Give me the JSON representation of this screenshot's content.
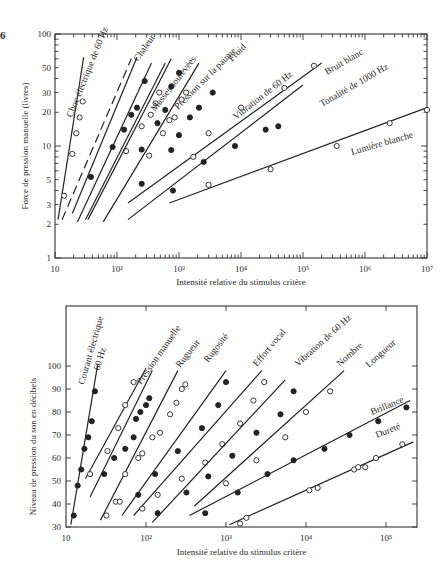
{
  "figure_number": "6",
  "chart_data": [
    {
      "type": "scatter",
      "scale": "log-log",
      "title": "",
      "xlabel": "Intensité relative du stimulus critère",
      "ylabel": "Force de pression manuelle (livres)",
      "xlim": [
        10,
        10000000
      ],
      "ylim": [
        1,
        100
      ],
      "xticks": [
        "10",
        "10²",
        "10³",
        "10⁴",
        "10⁵",
        "10⁶",
        "10⁷"
      ],
      "yticks": [
        1,
        2,
        3,
        5,
        10,
        20,
        30,
        50,
        100
      ],
      "grid": false,
      "legend": "inline labels",
      "series": [
        {
          "name": "Choc électrique de 60 Hz",
          "marker": "open",
          "line": [
            [
              11.2,
              2.2
            ],
            [
              29,
              62
            ]
          ],
          "points": [
            [
              14,
              3.6
            ],
            [
              19,
              8.5
            ],
            [
              22,
              13
            ],
            [
              25,
              18
            ],
            [
              28,
              25
            ]
          ]
        },
        {
          "name": "(ligne pointillée)",
          "marker": "none",
          "dashed": true,
          "line": [
            [
              13,
              2.2
            ],
            [
              170,
              60
            ]
          ],
          "points": []
        },
        {
          "name": "Chaleur",
          "marker": "filled",
          "line": [
            [
              19,
              2.5
            ],
            [
              210,
              62
            ]
          ],
          "points": [
            [
              38,
              5.3
            ],
            [
              85,
              9.8
            ],
            [
              130,
              14
            ],
            [
              170,
              19
            ],
            [
              210,
              22
            ],
            [
              280,
              38
            ]
          ]
        },
        {
          "name": "Masses soulevées",
          "marker": "open",
          "line": [
            [
              23,
              2.1
            ],
            [
              360,
              55
            ]
          ],
          "points": [
            [
              140,
              9
            ],
            [
              250,
              15
            ],
            [
              350,
              19
            ],
            [
              420,
              24
            ],
            [
              480,
              30
            ]
          ]
        },
        {
          "name": "Pression sur la paume",
          "marker": "filled",
          "line": [
            [
              31,
              2.2
            ],
            [
              600,
              55
            ]
          ],
          "points": [
            [
              250,
              9.3
            ],
            [
              450,
              16
            ],
            [
              600,
              21
            ],
            [
              750,
              34
            ],
            [
              1000,
              45
            ]
          ]
        },
        {
          "name": "Froid",
          "marker": "open",
          "line": [
            [
              34,
              2.2
            ],
            [
              750,
              60
            ]
          ],
          "points": [
            [
              330,
              8.2
            ],
            [
              550,
              13
            ],
            [
              700,
              17
            ],
            [
              850,
              18
            ],
            [
              1100,
              26
            ],
            [
              1300,
              30
            ]
          ]
        },
        {
          "name": "Vibration de 60 Hz",
          "marker": "filled",
          "line": [
            [
              60,
              2.1
            ],
            [
              2100,
              55
            ]
          ],
          "points": [
            [
              250,
              4.6
            ],
            [
              750,
              9.2
            ],
            [
              1000,
              12.5
            ],
            [
              1500,
              18
            ],
            [
              2100,
              22
            ],
            [
              3500,
              30
            ]
          ]
        },
        {
          "name": "Bruit blanc",
          "marker": "open",
          "line": [
            [
              150,
              3.1
            ],
            [
              200000,
              55
            ]
          ],
          "points": [
            [
              1700,
              8
            ],
            [
              3000,
              13
            ],
            [
              10000,
              22
            ],
            [
              50000,
              33
            ],
            [
              150000,
              52
            ]
          ]
        },
        {
          "name": "Tonalité de 1000 Hz",
          "marker": "filled",
          "line": [
            [
              150,
              2.2
            ],
            [
              100000,
              35
            ]
          ],
          "points": [
            [
              800,
              4
            ],
            [
              2500,
              7.2
            ],
            [
              8000,
              10
            ],
            [
              25000,
              14
            ],
            [
              40000,
              15
            ]
          ]
        },
        {
          "name": "Lumière blanche",
          "marker": "open",
          "line": [
            [
              700,
              3.1
            ],
            [
              10000000,
              22
            ]
          ],
          "points": [
            [
              3000,
              4.5
            ],
            [
              30000,
              6.2
            ],
            [
              350000,
              10
            ],
            [
              2500000,
              16
            ],
            [
              10000000,
              21
            ]
          ]
        }
      ]
    },
    {
      "type": "scatter",
      "scale": "semilog-x",
      "title": "",
      "xlabel": "Intensité relative du stimulus critère",
      "ylabel": "Niveau de pression du son en décibels",
      "xlim": [
        10,
        250000
      ],
      "ylim": [
        30,
        120
      ],
      "xticks": [
        "10",
        "10²",
        "10³",
        "10⁴",
        "10⁵"
      ],
      "yticks": [
        30,
        40,
        50,
        60,
        70,
        80,
        90,
        100
      ],
      "grid": false,
      "legend": "inline labels",
      "series": [
        {
          "name": "Courant électrique 60 Hz",
          "marker": "filled",
          "line": [
            [
              11.5,
              31
            ],
            [
              25,
              101
            ]
          ],
          "points": [
            [
              12.5,
              35
            ],
            [
              14,
              48
            ],
            [
              15.5,
              55
            ],
            [
              17,
              64
            ],
            [
              19,
              69
            ],
            [
              21,
              76
            ],
            [
              23,
              89
            ]
          ]
        },
        {
          "name": "Pression manuelle",
          "marker": "open",
          "line": [
            [
              17.5,
              51
            ],
            [
              100,
              99
            ]
          ],
          "points": [
            [
              20,
              53
            ],
            [
              33,
              63
            ],
            [
              45,
              73
            ],
            [
              55,
              83
            ],
            [
              70,
              93
            ]
          ]
        },
        {
          "name": "Rugueur",
          "marker": "filled",
          "line": [
            [
              20,
              43
            ],
            [
              120,
              98
            ]
          ],
          "points": [
            [
              30,
              53
            ],
            [
              40,
              60
            ],
            [
              55,
              64
            ],
            [
              70,
              69
            ],
            [
              75,
              77
            ],
            [
              85,
              80
            ],
            [
              100,
              83
            ],
            [
              110,
              86
            ]
          ]
        },
        {
          "name": "Rugosité",
          "marker": "open",
          "line": [
            [
              27,
              33
            ],
            [
              250,
              98
            ]
          ],
          "points": [
            [
              32,
              35
            ],
            [
              42,
              41
            ],
            [
              47,
              41
            ],
            [
              55,
              53
            ],
            [
              80,
              60
            ],
            [
              90,
              62
            ],
            [
              120,
              69
            ],
            [
              150,
              71
            ],
            [
              200,
              79
            ],
            [
              240,
              84
            ],
            [
              280,
              90
            ],
            [
              310,
              92
            ]
          ]
        },
        {
          "name": "Effort vocal",
          "marker": "filled",
          "line": [
            [
              50,
              35
            ],
            [
              1000,
              98
            ]
          ],
          "points": [
            [
              80,
              44
            ],
            [
              130,
              53
            ],
            [
              250,
              63
            ],
            [
              500,
              73
            ],
            [
              800,
              83
            ],
            [
              1000,
              93
            ]
          ]
        },
        {
          "name": "Vibration de 60 Hz",
          "marker": "open",
          "line": [
            [
              70,
              35
            ],
            [
              2800,
              98
            ]
          ],
          "points": [
            [
              90,
              38
            ],
            [
              140,
              44
            ],
            [
              280,
              51
            ],
            [
              550,
              58
            ],
            [
              900,
              66
            ],
            [
              1500,
              75
            ],
            [
              2200,
              85
            ],
            [
              3000,
              93
            ]
          ]
        },
        {
          "name": "Nombre",
          "marker": "filled",
          "line": [
            [
              120,
              32
            ],
            [
              5500,
              94
            ]
          ],
          "points": [
            [
              140,
              36
            ],
            [
              320,
              45
            ],
            [
              600,
              52
            ],
            [
              1200,
              61
            ],
            [
              2400,
              71
            ],
            [
              4800,
              79
            ],
            [
              7000,
              89
            ]
          ]
        },
        {
          "name": "Longueur",
          "marker": "open",
          "line": [
            [
              400,
              39
            ],
            [
              30000,
              98
            ]
          ],
          "points": [
            [
              1000,
              49
            ],
            [
              2400,
              59
            ],
            [
              5500,
              69
            ],
            [
              10000,
              80
            ],
            [
              20000,
              89
            ]
          ]
        },
        {
          "name": "Brillance",
          "marker": "filled",
          "line": [
            [
              350,
              35
            ],
            [
              200000,
              85
            ]
          ],
          "points": [
            [
              550,
              36
            ],
            [
              1400,
              45
            ],
            [
              3300,
              53
            ],
            [
              7000,
              59
            ],
            [
              17000,
              64
            ],
            [
              35000,
              70
            ],
            [
              80000,
              76
            ],
            [
              180000,
              82
            ]
          ]
        },
        {
          "name": "Dureté",
          "marker": "open",
          "line": [
            [
              1100,
              31
            ],
            [
              220000,
              67
            ]
          ],
          "points": [
            [
              1500,
              31.5
            ],
            [
              1800,
              34
            ],
            [
              11000,
              46
            ],
            [
              14000,
              47
            ],
            [
              40000,
              55
            ],
            [
              45000,
              56
            ],
            [
              55000,
              56
            ],
            [
              75000,
              60
            ],
            [
              160000,
              66
            ]
          ]
        }
      ]
    }
  ],
  "labels": {
    "top_xlabel": "Intensité relative du stimulus critère",
    "top_ylabel": "Force de pression manuelle (livres)",
    "bottom_xlabel": "Intensité relative du stimulus critère",
    "bottom_ylabel": "Niveau de pression du son en décibels"
  }
}
